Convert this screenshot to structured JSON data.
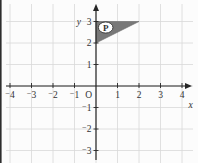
{
  "figure": {
    "type": "coordinate-plane",
    "background_color": "#fcfcfc",
    "page_edge_color": "#2e2e2e",
    "text_color": "#333333",
    "grid": {
      "color": "#d8d8d8",
      "x_min": -4,
      "x_max": 4,
      "y_min": -3,
      "y_max": 3
    },
    "axes": {
      "color": "#262626",
      "origin_label": "O",
      "x": {
        "label": "x",
        "tick_values": [
          -4,
          -3,
          -2,
          -1,
          1,
          2,
          3,
          4
        ],
        "tick_labels": [
          "⁻4",
          "⁻3",
          "⁻2",
          "⁻1",
          "1",
          "2",
          "3",
          "4"
        ]
      },
      "y": {
        "label": "y",
        "tick_values": [
          3,
          2,
          1,
          -1,
          -2,
          -3
        ],
        "tick_labels": [
          "3",
          "2",
          "1",
          "⁻1",
          "⁻2",
          "⁻3"
        ]
      }
    },
    "shapes": [
      {
        "id": "P",
        "type": "polygon",
        "vertices": [
          [
            0,
            2
          ],
          [
            0,
            3
          ],
          [
            2,
            3
          ]
        ],
        "fill": "#787878",
        "edge": "#696969",
        "label": {
          "text": "P",
          "center": [
            0.45,
            2.72
          ],
          "badge_fill": "#ffffff",
          "badge_stroke": "#3d3d3d",
          "text_color": "#222222"
        }
      }
    ],
    "layout": {
      "width": 198,
      "height": 163,
      "origin_px": [
        96,
        86
      ],
      "unit_px": 21.5
    }
  }
}
